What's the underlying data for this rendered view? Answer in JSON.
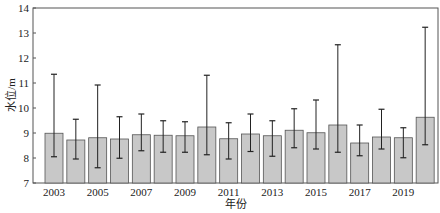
{
  "chart_data": {
    "type": "bar",
    "title": "",
    "xlabel": "年份",
    "ylabel": "水位/m",
    "ylim": [
      7,
      14
    ],
    "yticks": [
      7,
      8,
      9,
      10,
      11,
      12,
      13,
      14
    ],
    "grid": false,
    "legend": null,
    "categories": [
      "2003",
      "2004",
      "2005",
      "2006",
      "2007",
      "2008",
      "2009",
      "2010",
      "2011",
      "2012",
      "2013",
      "2014",
      "2015",
      "2016",
      "2017",
      "2018",
      "2019",
      "2020"
    ],
    "xtick_labels_shown": [
      "2003",
      "2005",
      "2007",
      "2009",
      "2011",
      "2013",
      "2015",
      "2017",
      "2019"
    ],
    "series": [
      {
        "name": "平均水位",
        "values": [
          8.99,
          8.72,
          8.81,
          8.76,
          8.93,
          8.91,
          8.89,
          9.24,
          8.77,
          8.96,
          8.89,
          9.11,
          9.01,
          9.32,
          8.6,
          8.84,
          8.81,
          9.63
        ],
        "error_max": [
          11.35,
          9.55,
          10.92,
          9.65,
          9.76,
          9.49,
          9.45,
          11.31,
          9.41,
          9.76,
          9.49,
          9.97,
          10.32,
          12.53,
          9.32,
          9.95,
          9.21,
          13.23
        ],
        "error_min": [
          8.05,
          7.96,
          7.61,
          7.99,
          8.29,
          8.23,
          8.23,
          8.13,
          7.96,
          8.26,
          8.07,
          8.41,
          8.36,
          8.23,
          8.09,
          8.36,
          8.01,
          8.53
        ]
      }
    ],
    "colors": {
      "bar_fill": "#c8c8c8",
      "bar_stroke": "#555555",
      "error_bar": "#222222",
      "axis": "#555555"
    }
  }
}
